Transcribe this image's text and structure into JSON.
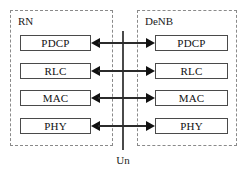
{
  "diagram": {
    "entities": [
      {
        "id": "rn",
        "label": "RN",
        "side": "left",
        "layers": [
          {
            "label": "PDCP"
          },
          {
            "label": "RLC"
          },
          {
            "label": "MAC"
          },
          {
            "label": "PHY"
          }
        ]
      },
      {
        "id": "denb",
        "label": "DeNB",
        "side": "right",
        "layers": [
          {
            "label": "PDCP"
          },
          {
            "label": "RLC"
          },
          {
            "label": "MAC"
          },
          {
            "label": "PHY"
          }
        ]
      }
    ],
    "interface": {
      "label": "Un",
      "orientation": "vertical"
    },
    "connectors": [
      {
        "from": "rn.PDCP",
        "to": "denb.PDCP",
        "style": "double-arrow"
      },
      {
        "from": "rn.RLC",
        "to": "denb.RLC",
        "style": "double-arrow"
      },
      {
        "from": "rn.MAC",
        "to": "denb.MAC",
        "style": "double-arrow"
      },
      {
        "from": "rn.PHY",
        "to": "denb.PHY",
        "style": "double-arrow"
      }
    ],
    "colors": {
      "entity_border": "#8a8a8a",
      "layer_border": "#4a4a4a",
      "arrow": "#111111",
      "text": "#111111",
      "background": "#ffffff"
    }
  }
}
